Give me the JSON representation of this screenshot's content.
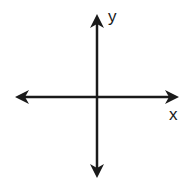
{
  "diagram": {
    "type": "cartesian-axes",
    "labels": {
      "x": "x",
      "y": "y"
    },
    "colors": {
      "axis": "#1a1a1a",
      "background": "#ffffff"
    },
    "origin": [
      97,
      97
    ],
    "arrows": [
      "left",
      "right",
      "up",
      "down"
    ]
  }
}
